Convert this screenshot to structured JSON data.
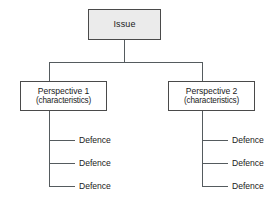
{
  "diagram": {
    "type": "hierarchy-tree",
    "colors": {
      "background": "#ffffff",
      "box_border": "#4a4a4a",
      "box_fill_root": "#ebebeb",
      "box_fill_branch": "#ffffff",
      "connector": "#555b5e",
      "text": "#1a1a1a"
    },
    "root": {
      "label": "Issue"
    },
    "branches": [
      {
        "label": "Perspective 1",
        "sublabel": "(characteristics)",
        "leaves": [
          {
            "label": "Defence"
          },
          {
            "label": "Defence"
          },
          {
            "label": "Defence"
          }
        ]
      },
      {
        "label": "Perspective 2",
        "sublabel": "(characteristics)",
        "leaves": [
          {
            "label": "Defence"
          },
          {
            "label": "Defence"
          },
          {
            "label": "Defence"
          }
        ]
      }
    ]
  }
}
